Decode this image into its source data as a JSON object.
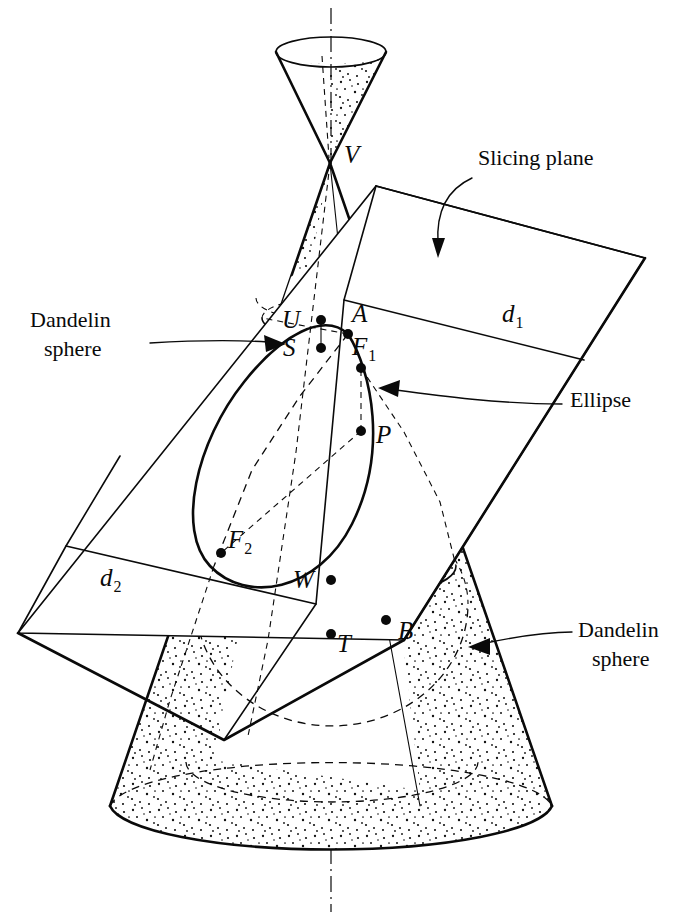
{
  "figure": {
    "background_color": "#ffffff",
    "ink_color": "#0a0a0a",
    "width": 684,
    "height": 920
  },
  "callouts": [
    {
      "id": "slicing-plane",
      "label": "Slicing plane",
      "label_line1": "Slicing plane",
      "label_line2": "",
      "x": 478,
      "y": 165,
      "anchor": "start"
    },
    {
      "id": "dandelin-sphere-upper",
      "label": "Dandelin sphere",
      "label_line1": "Dandelin",
      "label_line2": "sphere",
      "x": 30,
      "y": 327,
      "anchor": "start"
    },
    {
      "id": "ellipse",
      "label": "Ellipse",
      "label_line1": "Ellipse",
      "label_line2": "",
      "x": 570,
      "y": 407,
      "anchor": "start"
    },
    {
      "id": "dandelin-sphere-lower",
      "label": "Dandelin sphere",
      "label_line1": "Dandelin",
      "label_line2": "sphere",
      "x": 578,
      "y": 637,
      "anchor": "start"
    }
  ],
  "points": [
    {
      "id": "V",
      "label": "V",
      "sub": "",
      "label_x": 344,
      "label_y": 163,
      "dot_x": 330,
      "dot_y": 163,
      "has_dot": false
    },
    {
      "id": "U",
      "label": "U",
      "sub": "",
      "label_x": 282,
      "label_y": 328,
      "dot_x": 321,
      "dot_y": 320,
      "has_dot": true
    },
    {
      "id": "A",
      "label": "A",
      "sub": "",
      "label_x": 352,
      "label_y": 322,
      "dot_x": 348,
      "dot_y": 334,
      "has_dot": true
    },
    {
      "id": "S",
      "label": "S",
      "sub": "",
      "label_x": 283,
      "label_y": 356,
      "dot_x": 321,
      "dot_y": 348,
      "has_dot": true
    },
    {
      "id": "F1",
      "label": "F",
      "sub": "1",
      "label_x": 352,
      "label_y": 355,
      "dot_x": 361,
      "dot_y": 368,
      "has_dot": true
    },
    {
      "id": "P",
      "label": "P",
      "sub": "",
      "label_x": 376,
      "label_y": 443,
      "dot_x": 361,
      "dot_y": 431,
      "has_dot": true
    },
    {
      "id": "F2",
      "label": "F",
      "sub": "2",
      "label_x": 228,
      "label_y": 548,
      "dot_x": 221,
      "dot_y": 553,
      "has_dot": true
    },
    {
      "id": "W",
      "label": "W",
      "sub": "",
      "label_x": 293,
      "label_y": 588,
      "dot_x": 331,
      "dot_y": 580,
      "has_dot": true
    },
    {
      "id": "T",
      "label": "T",
      "sub": "",
      "label_x": 337,
      "label_y": 652,
      "dot_x": 331,
      "dot_y": 634,
      "has_dot": true
    },
    {
      "id": "B",
      "label": "B",
      "sub": "",
      "label_x": 398,
      "label_y": 639,
      "dot_x": 386,
      "dot_y": 620,
      "has_dot": true
    }
  ],
  "directrices": [
    {
      "id": "d1",
      "label": "d",
      "sub": "1",
      "x": 502,
      "y": 322
    },
    {
      "id": "d2",
      "label": "d",
      "sub": "2",
      "x": 100,
      "y": 586
    }
  ]
}
